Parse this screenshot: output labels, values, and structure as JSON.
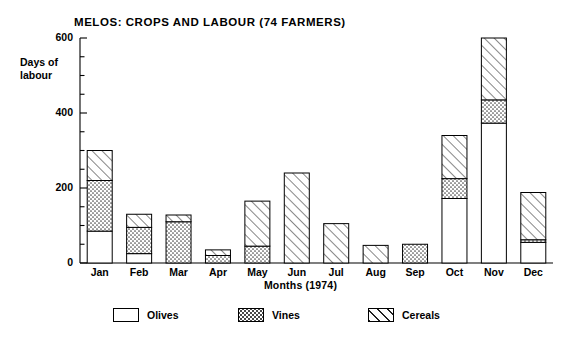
{
  "chart_data": {
    "type": "bar",
    "stacked": true,
    "title": "MELOS:  CROPS AND LABOUR (74 FARMERS)",
    "xlabel": "Months (1974)",
    "ylabel": "Days of labour",
    "ylabel_lines": [
      "Days of",
      "labour"
    ],
    "categories": [
      "Jan",
      "Feb",
      "Mar",
      "Apr",
      "May",
      "Jun",
      "Jul",
      "Aug",
      "Sep",
      "Oct",
      "Nov",
      "Dec"
    ],
    "series": [
      {
        "name": "Olives",
        "fill": "solid-white",
        "values": [
          85,
          25,
          0,
          0,
          0,
          0,
          0,
          0,
          0,
          172,
          373,
          55
        ]
      },
      {
        "name": "Vines",
        "fill": "dotted",
        "values": [
          135,
          70,
          110,
          20,
          45,
          0,
          0,
          0,
          50,
          53,
          62,
          7
        ]
      },
      {
        "name": "Cereals",
        "fill": "diagonal-hatch",
        "values": [
          80,
          35,
          18,
          15,
          120,
          240,
          105,
          47,
          0,
          115,
          165,
          126
        ]
      }
    ],
    "totals": [
      300,
      130,
      128,
      35,
      165,
      240,
      105,
      47,
      50,
      340,
      600,
      188
    ],
    "ylim": [
      0,
      600
    ],
    "ymajor_ticks": [
      0,
      200,
      400,
      600
    ],
    "ytick_labels": [
      "0",
      "200",
      "400",
      "600"
    ],
    "yminor_tick_interval": 50,
    "grid": false,
    "legend_position": "bottom",
    "legend": [
      {
        "label": "Olives",
        "fill": "solid-white"
      },
      {
        "label": "Vines",
        "fill": "dotted"
      },
      {
        "label": "Cereals",
        "fill": "diagonal-hatch"
      }
    ]
  }
}
